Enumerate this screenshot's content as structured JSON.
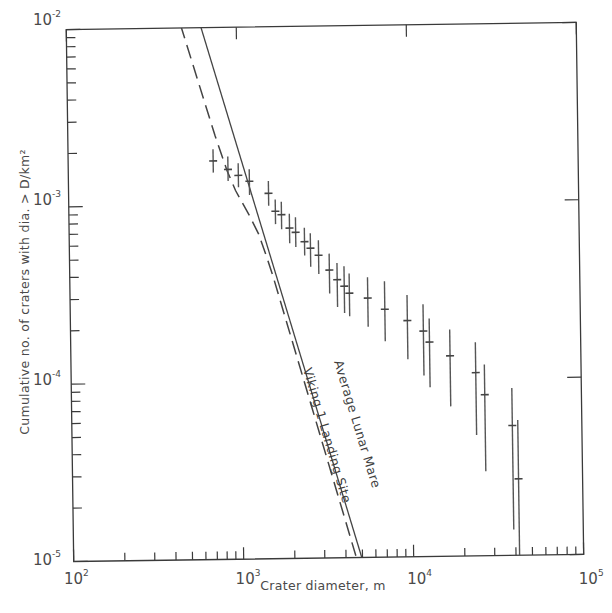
{
  "chart_data": {
    "type": "scatter",
    "title": "",
    "xlabel": "Crater diameter, m",
    "ylabel": "Cumulative no. of craters with dia. > D/km²",
    "xscale": "log",
    "yscale": "log",
    "xlim": [
      100,
      100000
    ],
    "ylim": [
      1e-05,
      0.01
    ],
    "grid": false,
    "legend": null,
    "x_ticks": [
      {
        "value": 100,
        "base": "10",
        "exp": "2"
      },
      {
        "value": 1000,
        "base": "10",
        "exp": "3"
      },
      {
        "value": 10000,
        "base": "10",
        "exp": "4"
      },
      {
        "value": 100000,
        "base": "10",
        "exp": "5"
      }
    ],
    "y_ticks": [
      {
        "value": 0.01,
        "base": "10",
        "exp": "-2"
      },
      {
        "value": 0.001,
        "base": "10",
        "exp": "-3"
      },
      {
        "value": 0.0001,
        "base": "10",
        "exp": "-4"
      },
      {
        "value": 1e-05,
        "base": "10",
        "exp": "-5"
      }
    ],
    "series": [
      {
        "name": "Viking 1 Landing Site crater counts",
        "style": "points with vertical error bars",
        "points": [
          {
            "x": 713,
            "y": 0.00177,
            "ylo": 0.00152,
            "yhi": 0.00206
          },
          {
            "x": 870,
            "y": 0.00158,
            "ylo": 0.00136,
            "yhi": 0.00187
          },
          {
            "x": 1000,
            "y": 0.00146,
            "ylo": 0.00125,
            "yhi": 0.00171
          },
          {
            "x": 1160,
            "y": 0.00135,
            "ylo": 0.00113,
            "yhi": 0.00158
          },
          {
            "x": 1500,
            "y": 0.00115,
            "ylo": 0.00098,
            "yhi": 0.00135
          },
          {
            "x": 1640,
            "y": 0.00091,
            "ylo": 0.00077,
            "yhi": 0.00106
          },
          {
            "x": 1780,
            "y": 0.00087,
            "ylo": 0.00072,
            "yhi": 0.00103
          },
          {
            "x": 1980,
            "y": 0.00073,
            "ylo": 0.0006,
            "yhi": 0.00088
          },
          {
            "x": 2150,
            "y": 0.00069,
            "ylo": 0.00057,
            "yhi": 0.00084
          },
          {
            "x": 2420,
            "y": 0.00061,
            "ylo": 0.00051,
            "yhi": 0.00073
          },
          {
            "x": 2620,
            "y": 0.00056,
            "ylo": 0.00044,
            "yhi": 0.00068
          },
          {
            "x": 2920,
            "y": 0.00051,
            "ylo": 0.0004,
            "yhi": 0.00062
          },
          {
            "x": 3370,
            "y": 0.00042,
            "ylo": 0.00031,
            "yhi": 0.00052
          },
          {
            "x": 3740,
            "y": 0.00037,
            "ylo": 0.00026,
            "yhi": 0.00046
          },
          {
            "x": 4110,
            "y": 0.00034,
            "ylo": 0.00024,
            "yhi": 0.00044
          },
          {
            "x": 4400,
            "y": 0.00031,
            "ylo": 0.00023,
            "yhi": 0.0004
          },
          {
            "x": 5640,
            "y": 0.00029,
            "ylo": 0.0002,
            "yhi": 0.00038
          },
          {
            "x": 7090,
            "y": 0.00025,
            "ylo": 0.000165,
            "yhi": 0.00036
          },
          {
            "x": 9600,
            "y": 0.000215,
            "ylo": 0.00013,
            "yhi": 0.0003
          },
          {
            "x": 11900,
            "y": 0.000187,
            "ylo": 0.000105,
            "yhi": 0.000265
          },
          {
            "x": 12900,
            "y": 0.000162,
            "ylo": 9e-05,
            "yhi": 0.00022
          },
          {
            "x": 17000,
            "y": 0.000135,
            "ylo": 7e-05,
            "yhi": 0.00019
          },
          {
            "x": 24000,
            "y": 0.000108,
            "ylo": 4.8e-05,
            "yhi": 0.00016
          },
          {
            "x": 27000,
            "y": 8.1e-05,
            "ylo": 3e-05,
            "yhi": 0.00012
          },
          {
            "x": 39000,
            "y": 5.4e-05,
            "ylo": 1.4e-05,
            "yhi": 8.8e-05
          },
          {
            "x": 42000,
            "y": 2.7e-05,
            "ylo": 1e-05,
            "yhi": 5.8e-05
          }
        ]
      },
      {
        "name": "Average Lunar Mare",
        "style": "solid line",
        "label": "Average Lunar Mare",
        "points": [
          {
            "x": 613,
            "y": 0.0104
          },
          {
            "x": 4950,
            "y": 1e-05
          }
        ]
      },
      {
        "name": "Viking 1 Landing Site",
        "style": "dashed line",
        "label": "Viking 1 Landing Site",
        "points": [
          {
            "x": 470,
            "y": 0.0104
          },
          {
            "x": 735,
            "y": 0.00245
          },
          {
            "x": 860,
            "y": 0.00155
          },
          {
            "x": 960,
            "y": 0.0012
          },
          {
            "x": 1150,
            "y": 0.00087
          },
          {
            "x": 1300,
            "y": 0.00068
          },
          {
            "x": 1450,
            "y": 0.0005
          },
          {
            "x": 1560,
            "y": 0.0004
          },
          {
            "x": 4600,
            "y": 1e-05
          }
        ]
      }
    ],
    "annotations": [
      {
        "text": "Average Lunar Mare",
        "along": "solid line"
      },
      {
        "text": "Viking 1 Landing Site",
        "along": "dashed line"
      }
    ]
  }
}
